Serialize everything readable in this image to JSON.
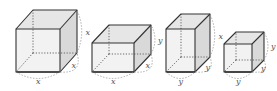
{
  "figure": {
    "colors": {
      "edge": "#333333",
      "front_face": "#f2f2f2",
      "top_face": "#e6e6e6",
      "side_face": "#d9d9d9",
      "hidden_edge": "#666666",
      "arc": "#999999",
      "label": "#555555"
    },
    "boxes": [
      {
        "name": "cube-x",
        "dims": [
          "x",
          "x",
          "x"
        ],
        "labels": {
          "bottom": "x",
          "depth": "x",
          "height": "x"
        },
        "front": {
          "x": 16,
          "y": 29,
          "w": 44,
          "h": 43
        },
        "offset": {
          "dx": 17,
          "dy": -19
        }
      },
      {
        "name": "box-xxy",
        "dims": [
          "x",
          "x",
          "y"
        ],
        "labels": {
          "bottom": "x",
          "depth": "x",
          "height": "y"
        },
        "front": {
          "x": 92,
          "y": 43,
          "w": 42,
          "h": 29
        },
        "offset": {
          "dx": 17,
          "dy": -18
        }
      },
      {
        "name": "box-yyx",
        "dims": [
          "y",
          "y",
          "x"
        ],
        "labels": {
          "bottom": "y",
          "depth": "y",
          "height": "x"
        },
        "front": {
          "x": 166,
          "y": 29,
          "w": 29,
          "h": 43
        },
        "offset": {
          "dx": 15,
          "dy": -15
        }
      },
      {
        "name": "cube-y",
        "dims": [
          "y",
          "y",
          "y"
        ],
        "labels": {
          "bottom": "y",
          "depth": "y",
          "height": "y"
        },
        "front": {
          "x": 224,
          "y": 44,
          "w": 28,
          "h": 28
        },
        "offset": {
          "dx": 12,
          "dy": -12
        }
      }
    ]
  }
}
